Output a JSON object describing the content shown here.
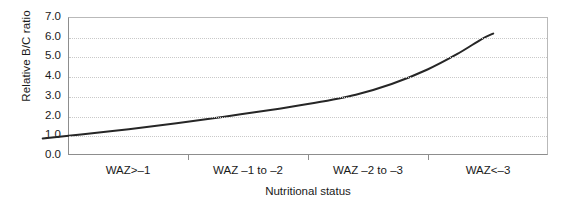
{
  "chart_data": {
    "type": "line",
    "title": "",
    "xlabel": "Nutritional status",
    "ylabel": "Relative B/C ratio",
    "categories": [
      "WAZ>–1",
      "WAZ –1 to –2",
      "WAZ –2 to –3",
      "WAZ<–3"
    ],
    "values": [
      0.8,
      1.5,
      2.6,
      6.2
    ],
    "x": [
      1,
      2,
      3,
      4
    ],
    "ylim": [
      0.0,
      7.0
    ],
    "y_ticks": [
      "0.0",
      "1.0",
      "2.0",
      "3.0",
      "4.0",
      "5.0",
      "6.0",
      "7.0"
    ],
    "y_tick_values": [
      0.0,
      1.0,
      2.0,
      3.0,
      4.0,
      5.0,
      6.0,
      7.0
    ],
    "grid": "horizontal-dotted",
    "legend": "none",
    "curve_points": [
      {
        "x": 0.28,
        "y": 0.8
      },
      {
        "x": 0.6,
        "y": 1.0
      },
      {
        "x": 1.0,
        "y": 1.28
      },
      {
        "x": 1.4,
        "y": 1.58
      },
      {
        "x": 1.8,
        "y": 1.92
      },
      {
        "x": 2.2,
        "y": 2.28
      },
      {
        "x": 2.55,
        "y": 2.62
      },
      {
        "x": 2.9,
        "y": 3.05
      },
      {
        "x": 3.2,
        "y": 3.6
      },
      {
        "x": 3.5,
        "y": 4.35
      },
      {
        "x": 3.75,
        "y": 5.15
      },
      {
        "x": 3.95,
        "y": 5.9
      },
      {
        "x": 4.05,
        "y": 6.2
      }
    ],
    "line_color": "#262626",
    "grid_color": "#c9c9c9",
    "axis_color": "#8d8d8d"
  }
}
